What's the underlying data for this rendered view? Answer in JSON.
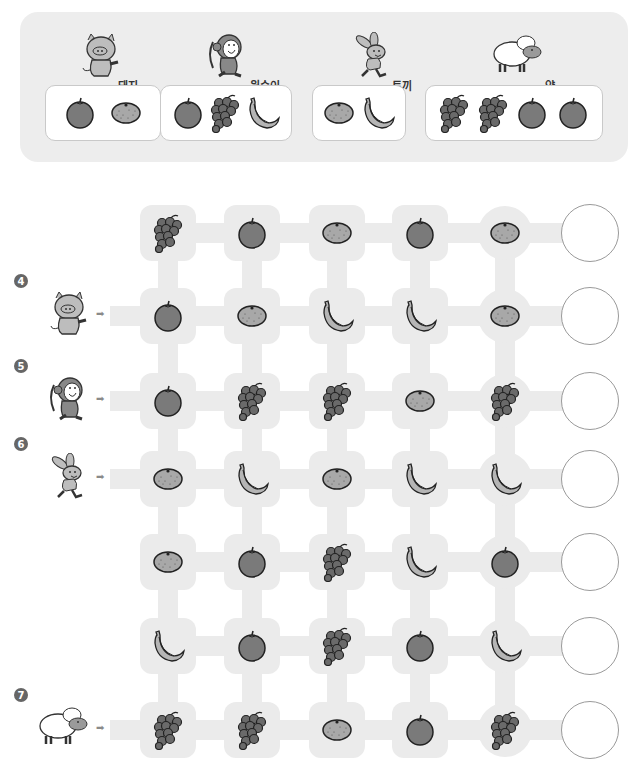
{
  "legend": {
    "groups": [
      {
        "animal": "pig",
        "label": "돼지",
        "fruits": [
          "apple",
          "tangerine"
        ]
      },
      {
        "animal": "monkey",
        "label": "원숭이",
        "fruits": [
          "apple",
          "grapes",
          "banana"
        ]
      },
      {
        "animal": "rabbit",
        "label": "토끼",
        "fruits": [
          "tangerine",
          "banana"
        ]
      },
      {
        "animal": "sheep",
        "label": "양",
        "fruits": [
          "grapes",
          "grapes",
          "apple",
          "apple"
        ]
      }
    ]
  },
  "maze": {
    "rows": [
      {
        "number": "",
        "animal": "",
        "fruits": [
          "grapes",
          "apple",
          "tangerine",
          "apple",
          "tangerine"
        ]
      },
      {
        "number": "4",
        "animal": "pig",
        "fruits": [
          "apple",
          "tangerine",
          "banana",
          "banana",
          "tangerine"
        ]
      },
      {
        "number": "5",
        "animal": "monkey",
        "fruits": [
          "apple",
          "grapes",
          "grapes",
          "tangerine",
          "grapes"
        ]
      },
      {
        "number": "6",
        "animal": "rabbit",
        "fruits": [
          "tangerine",
          "banana",
          "tangerine",
          "banana",
          "banana"
        ]
      },
      {
        "number": "",
        "animal": "",
        "fruits": [
          "tangerine",
          "apple",
          "grapes",
          "banana",
          "apple"
        ]
      },
      {
        "number": "",
        "animal": "",
        "fruits": [
          "banana",
          "apple",
          "grapes",
          "apple",
          "banana"
        ]
      },
      {
        "number": "7",
        "animal": "sheep",
        "fruits": [
          "grapes",
          "grapes",
          "tangerine",
          "apple",
          "grapes"
        ]
      }
    ],
    "answers": [
      "",
      "",
      "",
      "",
      "",
      "",
      ""
    ],
    "arrow_glyph": "➡"
  },
  "colors": {
    "track": "#ebebeb",
    "panel": "#ededed",
    "fruit_fill": "#7a7a7a",
    "tangerine_fill": "#a8a8a8",
    "banana_fill": "#b5b5b5",
    "answer_border": "#9a9a9a"
  }
}
